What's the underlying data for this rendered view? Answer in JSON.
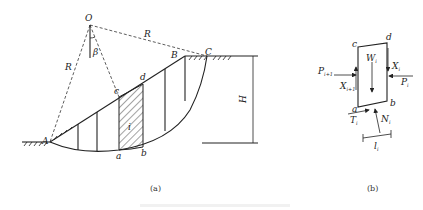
{
  "figure_a": {
    "panel_label": "(a)",
    "points": {
      "center": "O",
      "toe": "A",
      "crest": "B",
      "exit": "C",
      "slice_top_left": "c",
      "slice_top_right": "d",
      "slice_bottom_left": "a",
      "slice_bottom_right": "b"
    },
    "radius_label": "R",
    "angle_label": "β",
    "height_label": "H",
    "slice_index_label": "i",
    "slice_count": 6,
    "highlighted_slice": "i"
  },
  "figure_b": {
    "panel_label": "(b)",
    "corners": {
      "top_left": "c",
      "top_right": "d",
      "bottom_left": "a",
      "bottom_right": "b"
    },
    "forces": {
      "weight": {
        "sym": "W",
        "sub": "i"
      },
      "left_normal": {
        "sym": "P",
        "sub": "i+1"
      },
      "left_shear": {
        "sym": "X",
        "sub": "i+1"
      },
      "right_normal": {
        "sym": "P",
        "sub": "i"
      },
      "right_shear": {
        "sym": "X",
        "sub": "i"
      },
      "base_shear": {
        "sym": "T",
        "sub": "i"
      },
      "base_normal": {
        "sym": "N",
        "sub": "i"
      }
    },
    "width_label": {
      "sym": "l",
      "sub": "i"
    }
  },
  "caption": ""
}
